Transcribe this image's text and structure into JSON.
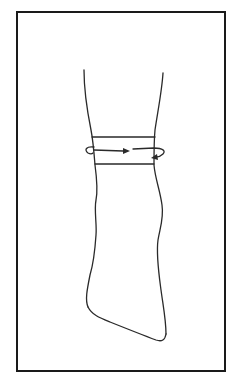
{
  "figure": {
    "type": "line-drawing",
    "frame_color": "#1a1a1a",
    "stroke_color": "#2a2a2a",
    "annotations": {
      "band": "two horizontal lines marking a circumferential band",
      "arrows": "two curved arrows indicating rotation/wrapping around the limb"
    }
  },
  "caption": {
    "text": ""
  }
}
